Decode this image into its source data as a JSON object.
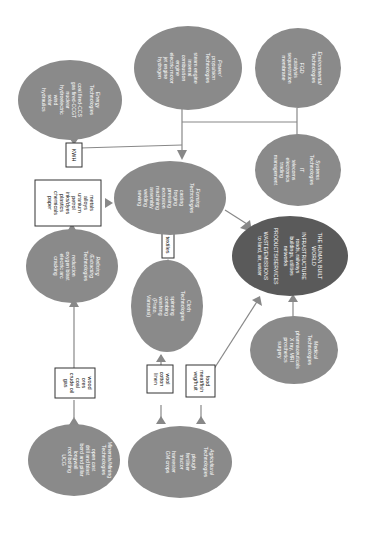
{
  "diagram": {
    "orientation": "rotated 90 degrees clockwise",
    "nodes": {
      "mining": {
        "title": [
          "Minerals/Mining",
          "Technologies"
        ],
        "items": [
          "open cast",
          "drill and blast",
          "bord and pillar",
          "longwall",
          "roof bolting",
          "UCG"
        ]
      },
      "agricultural": {
        "title": [
          "Agricultural",
          "Technologies"
        ],
        "items": [
          "plough",
          "fertiliser",
          "tractor",
          "harvester",
          "GM crops"
        ]
      },
      "refining": {
        "title": [
          "Refining",
          "/Extracting",
          "Technologies"
        ],
        "items": [
          "reduction",
          "oxygen blast",
          "electric arc",
          "cracking"
        ]
      },
      "cloth": {
        "title": [
          "Cloth",
          "Technologies"
        ],
        "items": [
          "spinning",
          "combing",
          "washing",
          "(Prato,",
          "Varanasi)"
        ]
      },
      "forming": {
        "title": [
          "Forming",
          "Technologies"
        ],
        "items": [
          "casting",
          "forging",
          "pressing",
          "extrusion",
          "machining",
          "assembly",
          "welding",
          "sewing"
        ]
      },
      "energy": {
        "title": [
          "Energy",
          "Technologies"
        ],
        "items": [
          "coal fired-CCS",
          "gas fired-CCGT",
          "nuclear",
          "hydroelectric",
          "wind",
          "solar",
          "hydraulics"
        ]
      },
      "power": {
        "title": [
          "Power/",
          "propulsion",
          "Technologies"
        ],
        "items": [
          "steam engine",
          "internal",
          "combustion",
          "engine",
          "electric motor",
          "jet engine",
          "hydrogen"
        ]
      },
      "environmental": {
        "title": [
          "Environmental",
          "Technologies"
        ],
        "items": [
          "FGD",
          "catalysis",
          "sequestration",
          "membrane"
        ]
      },
      "systems": {
        "title": [
          "Systems",
          "Technologies"
        ],
        "items": [
          "IT",
          "telecoms",
          "electronics",
          "trading",
          "management"
        ]
      },
      "built_world": {
        "title": [
          "THE HUMAN BUILT",
          "WORLD"
        ],
        "sections": [
          {
            "heading": "INFRASTRUCTURE",
            "items": [
              "roads, railways",
              "buildings, utilities",
              "networks"
            ]
          },
          {
            "heading": "PRODUCTS/SERVICES",
            "items": []
          },
          {
            "heading": "WASTE/EMISSIONS",
            "items": [
              "to land, air, water"
            ]
          }
        ]
      },
      "medical": {
        "title": [
          "Medical",
          "Technologies"
        ],
        "items": [
          "pharmaceuticals",
          "X ray, MRI",
          "prosthetics",
          "surgery"
        ]
      }
    },
    "boxes": {
      "raw_minerals": [
        "wood",
        "ores",
        "coal",
        "crude oil",
        "gas"
      ],
      "fibres": [
        "wool",
        "cotton",
        "linen"
      ],
      "food": [
        "food",
        "meat/fish",
        "veg/fruit"
      ],
      "materials": [
        "metals",
        "alloys",
        "uranium",
        "petrol",
        "inks/dyes",
        "plastics",
        "chemicals",
        "paper"
      ],
      "textiles": [
        "textiles"
      ],
      "kwh": [
        "KWH"
      ]
    },
    "colors": {
      "node": "#8a8a8a",
      "node_dark": "#5a5a5a",
      "line": "#888888",
      "box_border": "#333333"
    }
  }
}
